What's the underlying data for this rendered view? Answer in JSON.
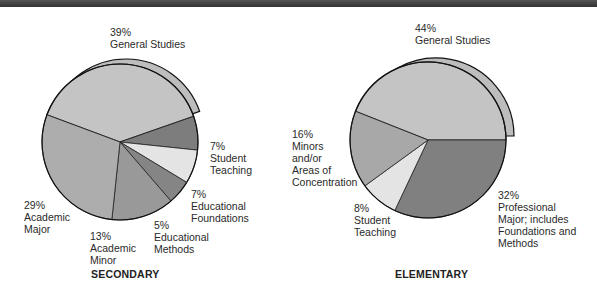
{
  "chart_data": [
    {
      "type": "pie",
      "title": "SECONDARY",
      "categories": [
        "General Studies",
        "Student Teaching",
        "Educational Foundations",
        "Educational Methods",
        "Academic Minor",
        "Academic Major"
      ],
      "values": [
        39,
        7,
        7,
        5,
        13,
        29
      ],
      "labels": [
        "39%\nGeneral Studies",
        "7%\nStudent\nTeaching",
        "7%\nEducational\nFoundations",
        "5%\nEducational\nMethods",
        "13%\nAcademic\nMinor",
        "29%\nAcademic\nMajor"
      ],
      "colors": [
        "#c4c4c4",
        "#7d7d7d",
        "#e4e4e4",
        "#858585",
        "#999999",
        "#adadad"
      ],
      "exploded": "General Studies"
    },
    {
      "type": "pie",
      "title": "ELEMENTARY",
      "categories": [
        "General Studies",
        "Professional Major; includes Foundations and Methods",
        "Student Teaching",
        "Minors and/or Areas of Concentration"
      ],
      "values": [
        44,
        32,
        8,
        16
      ],
      "labels": [
        "44%\nGeneral Studies",
        "32%\nProfessional\nMajor; includes\nFoundations and\nMethods",
        "8%\nStudent\nTeaching",
        "16%\nMinors\nand/or\nAreas of\nConcentration"
      ],
      "colors": [
        "#c4c4c4",
        "#808080",
        "#e4e4e4",
        "#a8a8a8"
      ],
      "exploded": "General Studies"
    }
  ],
  "titles": {
    "secondary": "SECONDARY",
    "elementary": "ELEMENTARY"
  },
  "labels": {
    "sec_general": "39%\nGeneral Studies",
    "sec_student": "7%\nStudent\nTeaching",
    "sec_found": "7%\nEducational\nFoundations",
    "sec_methods": "5%\nEducational\nMethods",
    "sec_minor": "13%\nAcademic\nMinor",
    "sec_major": "29%\nAcademic\nMajor",
    "ele_general": "44%\nGeneral Studies",
    "ele_minors": "16%\nMinors\nand/or\nAreas of\nConcentration",
    "ele_student": "8%\nStudent\nTeaching",
    "ele_prof": "32%\nProfessional\nMajor; includes\nFoundations and\nMethods"
  }
}
